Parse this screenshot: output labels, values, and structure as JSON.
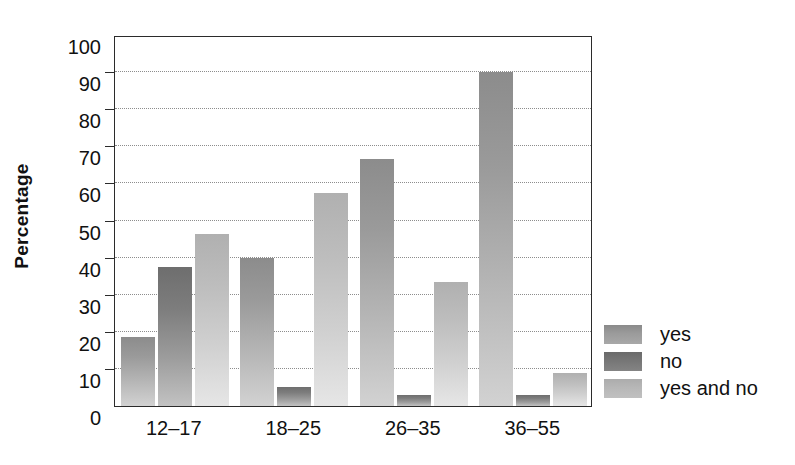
{
  "chart_data": {
    "type": "bar",
    "title": "",
    "xlabel": "",
    "ylabel": "Percentage",
    "ylim": [
      0,
      100
    ],
    "ytick_step": 10,
    "yticks": [
      0,
      10,
      20,
      30,
      40,
      50,
      60,
      70,
      80,
      90,
      100
    ],
    "ytick_labels": [
      "0",
      "10",
      "20",
      "30",
      "40",
      "50",
      "60",
      "70",
      "80",
      "90",
      "100"
    ],
    "grid": "horizontal-dotted",
    "legend_position": "right",
    "categories": [
      "12–17",
      "18–25",
      "26–35",
      "36–55"
    ],
    "series": [
      {
        "name": "yes",
        "color": "#9a9a9a",
        "values": [
          18.5,
          40.0,
          66.5,
          90.0
        ]
      },
      {
        "name": "no",
        "color": "#767676",
        "values": [
          37.5,
          5.0,
          3.0,
          3.0
        ]
      },
      {
        "name": "yes and no",
        "color": "#bdbdbd",
        "values": [
          46.5,
          57.5,
          33.5,
          9.0
        ]
      }
    ]
  },
  "legend": {
    "items": [
      {
        "label": "yes",
        "swatch": "s-yes"
      },
      {
        "label": "no",
        "swatch": "s-no"
      },
      {
        "label": "yes and no",
        "swatch": "s-yesno"
      }
    ]
  },
  "axis": {
    "y_title": "Percentage"
  }
}
